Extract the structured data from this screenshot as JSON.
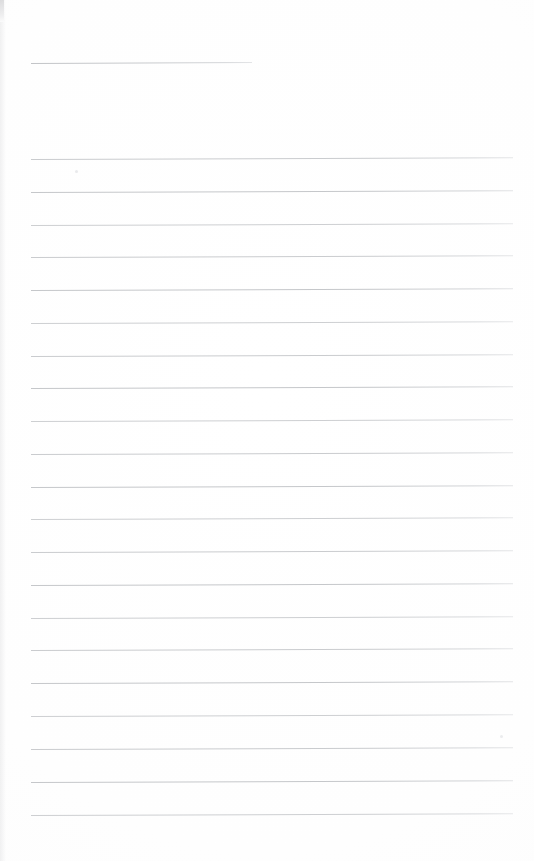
{
  "document": {
    "type": "scanned-lined-paper",
    "title": "Blank ruled notebook page",
    "page_width": 534,
    "page_height": 861,
    "background_color": "#fefefe",
    "text_content": "",
    "visible_text": []
  },
  "ruling": {
    "line_color": "#c5c7ca",
    "line_thickness_px": 1,
    "left_margin_x": 31,
    "right_edge_x": 513,
    "line_width_px": 482,
    "first_line_y": 159,
    "line_spacing_px": 32.8,
    "line_count": 21,
    "tilt_degrees": -0.22,
    "line_y_positions": [
      159,
      192,
      225,
      257,
      290,
      323,
      356,
      388,
      421,
      454,
      487,
      519,
      552,
      585,
      618,
      650,
      683,
      716,
      749,
      782,
      815
    ]
  },
  "header_rule": {
    "name": "header-rule",
    "y": 63,
    "x_start": 31,
    "x_end": 252,
    "width_px": 221,
    "color": "#c4c6c9",
    "tilt_degrees": -0.25
  },
  "artifacts": {
    "edge_artifact": {
      "label": "scan-edge-artifact",
      "x": 0,
      "y": 0,
      "width": 4,
      "height": 22,
      "color": "#d8d8da"
    },
    "specks": [
      {
        "label": "speck-upper-left",
        "x": 75,
        "y": 170,
        "size": 3,
        "color": "#e9eaec"
      },
      {
        "label": "speck-lower-right",
        "x": 500,
        "y": 735,
        "size": 3,
        "color": "#ebecee"
      }
    ]
  }
}
